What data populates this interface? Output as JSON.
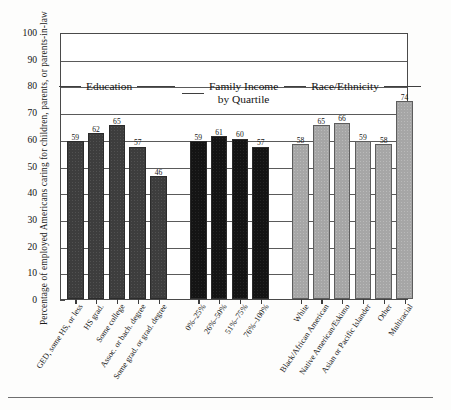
{
  "chart_data": {
    "type": "bar",
    "title": "",
    "xlabel": "",
    "ylabel": "Percentage of employed Americans caring for children, parents, or parents-in-law",
    "ylim": [
      0,
      100
    ],
    "ytick_step": 10,
    "yticks": [
      100,
      90,
      80,
      70,
      60,
      50,
      40,
      30,
      20,
      10,
      0
    ],
    "grid": true,
    "legend": "none",
    "groups": [
      {
        "name": "Education",
        "header_line1": "Education",
        "header_line2": "",
        "categories": [
          "GED, some HS, or less",
          "HS grad.",
          "Some college",
          "Assoc. or bach. degree",
          "Some grad. or grad. degree"
        ],
        "values": [
          59,
          62,
          65,
          57,
          46
        ],
        "color": "#3d3d3d"
      },
      {
        "name": "Family Income by Quartile",
        "header_line1": "Family Income",
        "header_line2": "by Quartile",
        "categories": [
          "0%–25%",
          "26%–50%",
          "51%–75%",
          "76%–100%"
        ],
        "values": [
          59,
          61,
          60,
          57
        ],
        "color": "#141414"
      },
      {
        "name": "Race/Ethnicity",
        "header_line1": "Race/Ethnicity",
        "header_line2": "",
        "categories": [
          "White",
          "Black/African American",
          "Native American/Eskimo",
          "Asian or Pacific Islander",
          "Other",
          "Multiracial"
        ],
        "values": [
          58,
          65,
          66,
          59,
          58,
          74
        ],
        "color": "#a6a6a6"
      }
    ]
  },
  "caption": {
    "text": ""
  }
}
